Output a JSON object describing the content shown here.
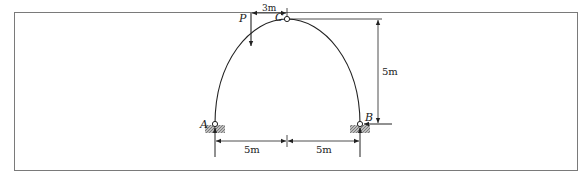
{
  "figure": {
    "frame_color": "#7a7a7a",
    "line_color": "#222222",
    "labels": {
      "support_left": "A",
      "support_right": "B",
      "hinge_top": "C",
      "load": "P"
    },
    "dimensions": {
      "load_offset": "3m",
      "height": "5m",
      "half_span_left": "5m",
      "half_span_right": "5m"
    }
  }
}
